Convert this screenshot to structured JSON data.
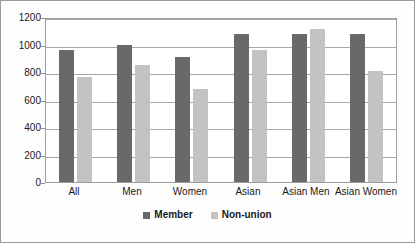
{
  "chart_data": {
    "type": "bar",
    "title": "",
    "subtitle": "",
    "xlabel": "",
    "ylabel": "",
    "ylim": [
      0,
      1200
    ],
    "ytick_step": 200,
    "yticks": [
      1200,
      1000,
      800,
      600,
      400,
      200,
      0
    ],
    "ytick_labels": [
      "1200",
      "1000",
      "800",
      "600",
      "400",
      "200",
      "0"
    ],
    "grid": true,
    "legend_position": "bottom",
    "categories": [
      "All",
      "Men",
      "Women",
      "Asian",
      "Asian Men",
      "Asian Women"
    ],
    "series": [
      {
        "name": "Member",
        "color": "#696969",
        "values": [
          973,
          1010,
          922,
          1090,
          1090,
          1090
        ]
      },
      {
        "name": "Non-union",
        "color": "#c3c3c3",
        "values": [
          776,
          863,
          688,
          973,
          1127,
          820
        ]
      }
    ]
  },
  "legend": {
    "entries": [
      {
        "label": "Member",
        "swatch": "legend-swatch-member"
      },
      {
        "label": "Non-union",
        "swatch": "legend-swatch-nonunion"
      }
    ]
  },
  "colors": {
    "member": "#696969",
    "non_union": "#c3c3c3",
    "gridline": "#a8a8a8",
    "border": "#9a9a9a",
    "plot_background": "#ffffff",
    "figure_background": "#fdfdfd",
    "text": "#1a1a1a"
  }
}
